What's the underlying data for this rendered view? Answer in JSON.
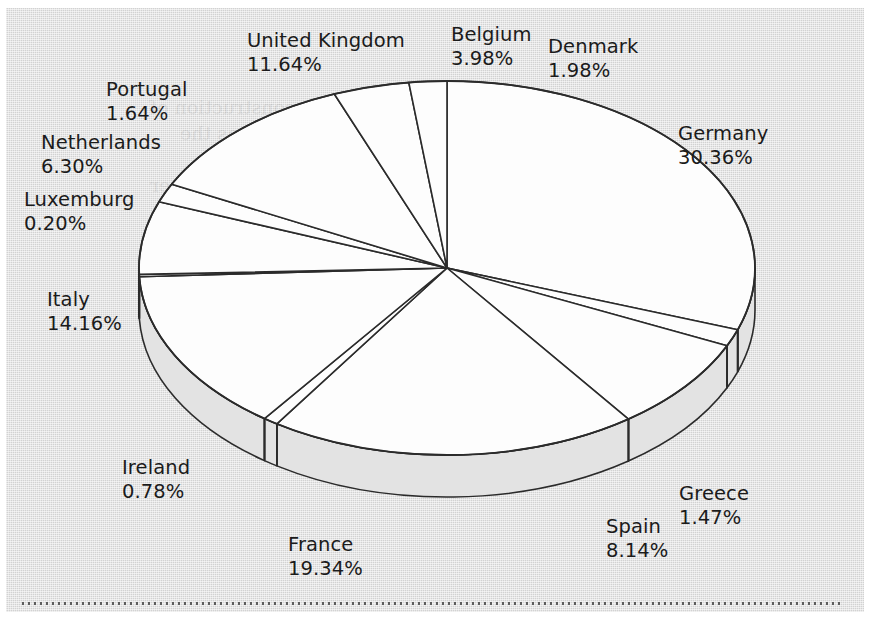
{
  "chart_data": {
    "type": "pie",
    "title": "",
    "subtitle": "",
    "xlabel": "",
    "ylabel": "",
    "legend_position": "none",
    "grid": false,
    "three_d": true,
    "start_angle_deg": 0,
    "direction": "clockwise",
    "value_suffix": "%",
    "categories": [
      "Germany",
      "Greece",
      "Spain",
      "France",
      "Ireland",
      "Italy",
      "Luxemburg",
      "Netherlands",
      "Portugal",
      "United Kingdom",
      "Belgium",
      "Denmark"
    ],
    "values": [
      30.36,
      1.47,
      8.14,
      19.34,
      0.78,
      14.16,
      0.2,
      6.3,
      1.64,
      11.64,
      3.98,
      1.98
    ],
    "labels": [
      "30.36%",
      "1.47%",
      "8.14%",
      "19.34%",
      "0.78%",
      "14.16%",
      "0.20%",
      "6.30%",
      "1.64%",
      "11.64%",
      "3.98%",
      "1.98%"
    ],
    "total": 100.0
  },
  "slices": [
    {
      "name": "Germany",
      "value": "30.36%",
      "label_x": 678,
      "label_y": 122,
      "align": "left"
    },
    {
      "name": "Greece",
      "value": "1.47%",
      "label_x": 679,
      "label_y": 482,
      "align": "left"
    },
    {
      "name": "Spain",
      "value": "8.14%",
      "label_x": 606,
      "label_y": 515,
      "align": "left"
    },
    {
      "name": "France",
      "value": "19.34%",
      "label_x": 288,
      "label_y": 533,
      "align": "left"
    },
    {
      "name": "Ireland",
      "value": "0.78%",
      "label_x": 122,
      "label_y": 456,
      "align": "left"
    },
    {
      "name": "Italy",
      "value": "14.16%",
      "label_x": 47,
      "label_y": 288,
      "align": "left"
    },
    {
      "name": "Luxemburg",
      "value": "0.20%",
      "label_x": 24,
      "label_y": 188,
      "align": "left"
    },
    {
      "name": "Netherlands",
      "value": "6.30%",
      "label_x": 41,
      "label_y": 131,
      "align": "left"
    },
    {
      "name": "Portugal",
      "value": "1.64%",
      "label_x": 106,
      "label_y": 78,
      "align": "left"
    },
    {
      "name": "United Kingdom",
      "value": "11.64%",
      "label_x": 247,
      "label_y": 29,
      "align": "left"
    },
    {
      "name": "Belgium",
      "value": "3.98%",
      "label_x": 451,
      "label_y": 23,
      "align": "left"
    },
    {
      "name": "Denmark",
      "value": "1.98%",
      "label_x": 548,
      "label_y": 35,
      "align": "left"
    }
  ],
  "style": {
    "background_color": "#d2d2d2",
    "pie_top_color": "#fdfdfd",
    "pie_side_color": "#e3e3e3",
    "outline_color": "#2b2b2b",
    "text_color": "#1b1b1b"
  },
  "bleed_text": [
    "the construction of",
    "the Union as the",
    "in the budget of",
    "of the Member",
    "the resources",
    "and Parliament the",
    "spend their revenues",
    "report on the",
    "revenue may be",
    "voted. Other contribu",
    "will need to calculate",
    "the next several"
  ]
}
